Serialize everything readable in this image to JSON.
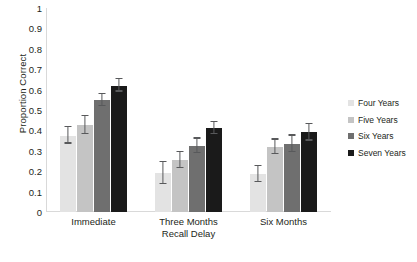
{
  "chart_data": {
    "type": "bar",
    "title": "",
    "xlabel": "Recall Delay",
    "ylabel": "Proportion Correct",
    "categories": [
      "Immediate",
      "Three Months",
      "Six Months"
    ],
    "ylim": [
      0,
      1
    ],
    "yticks": [
      "0",
      "0.1",
      "0.2",
      "0.3",
      "0.4",
      "0.5",
      "0.6",
      "0.7",
      "0.8",
      "0.9",
      "1"
    ],
    "ytick_values": [
      0,
      0.1,
      0.2,
      0.3,
      0.4,
      0.5,
      0.6,
      0.7,
      0.8,
      0.9,
      1
    ],
    "grid": false,
    "legend_position": "right",
    "series": [
      {
        "name": "Four Years",
        "color": "#e3e3e3",
        "values": [
          0.375,
          0.19,
          0.185
        ],
        "errors": [
          0.04,
          0.055,
          0.04
        ]
      },
      {
        "name": "Five Years",
        "color": "#c4c4c4",
        "values": [
          0.425,
          0.255,
          0.32
        ],
        "errors": [
          0.045,
          0.04,
          0.035
        ]
      },
      {
        "name": "Six Years",
        "color": "#6f6f6f",
        "values": [
          0.55,
          0.325,
          0.335
        ],
        "errors": [
          0.03,
          0.035,
          0.04
        ]
      },
      {
        "name": "Seven Years",
        "color": "#1a1a1a",
        "values": [
          0.62,
          0.41,
          0.39
        ],
        "errors": [
          0.03,
          0.03,
          0.04
        ]
      }
    ]
  },
  "axis": {
    "y_title": "Proportion Correct",
    "x_title": "Recall Delay"
  },
  "colors": {
    "axis_line": "#d9d9d9",
    "error_bar": "#58595b",
    "text": "#231f20",
    "background": "#ffffff"
  }
}
